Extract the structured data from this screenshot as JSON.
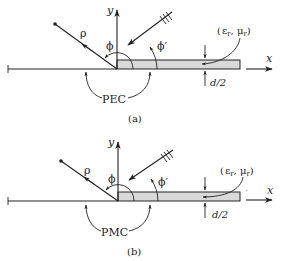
{
  "figure": {
    "panels": [
      {
        "id": "a",
        "caption": "(a)",
        "boundary_label": "PEC",
        "axis_x_label": "x",
        "axis_y_label": "y",
        "observation_label": "ρ",
        "angle_obs_label": "ϕ",
        "angle_inc_label": "ϕ′",
        "material_label": "(εr, μr)",
        "material_eps": "ε",
        "material_eps_sub": "r",
        "material_mu": "μ",
        "material_mu_sub": "r",
        "thickness_label": "d/2"
      },
      {
        "id": "b",
        "caption": "(b)",
        "boundary_label": "PMC",
        "axis_x_label": "x",
        "axis_y_label": "y",
        "observation_label": "ρ",
        "angle_obs_label": "ϕ",
        "angle_inc_label": "ϕ′",
        "material_label": "(εr, μr)",
        "material_eps": "ε",
        "material_eps_sub": "r",
        "material_mu": "μ",
        "material_mu_sub": "r",
        "thickness_label": "d/2"
      }
    ],
    "colors": {
      "line": "#222222",
      "slab_fill": "#d9d9d9",
      "background": "#ffffff"
    }
  }
}
